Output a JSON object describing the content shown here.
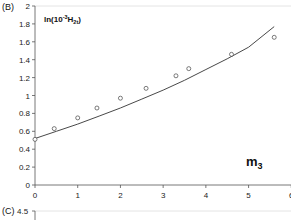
{
  "chart_data": [
    {
      "type": "scatter",
      "panel_label": "(B)",
      "title": "",
      "ylabel_main": "ln(10",
      "ylabel_sup": "-3",
      "ylabel_h": "H",
      "ylabel_sub": "2t",
      "ylabel_close": ")",
      "annotation_main": "m",
      "annotation_sub": "3",
      "xlabel": "",
      "xlim": [
        0,
        6
      ],
      "ylim": [
        0,
        2
      ],
      "x_ticks": [
        "0",
        "1",
        "2",
        "3",
        "4",
        "5",
        "6"
      ],
      "y_ticks": [
        "0",
        "0.2",
        "0.4",
        "0.6",
        "0.8",
        "1",
        "1.2",
        "1.4",
        "1.6",
        "1.8",
        "2"
      ],
      "grid": false,
      "series": [
        {
          "name": "observed",
          "kind": "points",
          "marker": "open-circle",
          "x": [
            0,
            0.45,
            1.0,
            1.45,
            2.0,
            2.6,
            3.3,
            3.6,
            4.6,
            5.6
          ],
          "y": [
            0.51,
            0.63,
            0.75,
            0.86,
            0.97,
            1.08,
            1.22,
            1.3,
            1.46,
            1.65
          ]
        },
        {
          "name": "fit",
          "kind": "line",
          "x": [
            0,
            0.5,
            1,
            1.5,
            2,
            2.5,
            3,
            3.5,
            4,
            4.5,
            5,
            5.6
          ],
          "y": [
            0.52,
            0.6,
            0.68,
            0.77,
            0.86,
            0.96,
            1.06,
            1.17,
            1.29,
            1.41,
            1.54,
            1.77
          ]
        }
      ]
    },
    {
      "type": "scatter",
      "panel_label": "(C)",
      "y_ticks": [
        "4.5"
      ],
      "note": "partially visible next panel"
    }
  ]
}
